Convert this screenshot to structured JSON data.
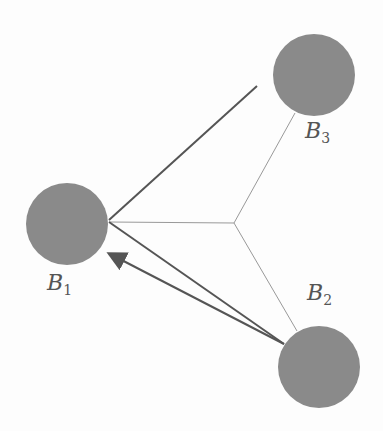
{
  "diagram": {
    "nodes": [
      {
        "id": "B1",
        "label": "B",
        "sub": "1",
        "cx": 67,
        "cy": 224,
        "r": 41,
        "label_x": 47,
        "label_y": 285
      },
      {
        "id": "B2",
        "label": "B",
        "sub": "2",
        "cx": 319,
        "cy": 367,
        "r": 41,
        "label_x": 307,
        "label_y": 283
      },
      {
        "id": "B3",
        "label": "B",
        "sub": "3",
        "cx": 314,
        "cy": 75,
        "r": 41,
        "label_x": 305,
        "label_y": 128
      }
    ],
    "colors": {
      "node_fill": "#8a8a8a",
      "thick_line": "#555555",
      "thin_line": "#999999",
      "label": "#555555"
    }
  }
}
